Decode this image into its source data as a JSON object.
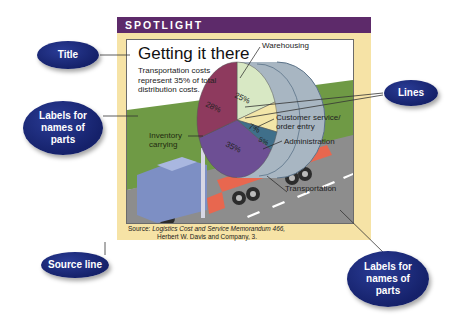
{
  "frame": {
    "header": "SPOTLIGHT",
    "title": "Getting it there",
    "subtitle": "Transportation costs represent 35% of total distribution costs.",
    "source_prefix": "Source: ",
    "source_italic": "Logistics Cost and Service Memorandum 466,",
    "source_line2": "Herbert W. Davis and Company, 3.",
    "part_labels": {
      "warehousing": "Warehousing",
      "inventory": "Inventory carrying",
      "customer_service": "Customer service/ order entry",
      "administration": "Administration",
      "transportation": "Transportation"
    },
    "pie_values": {
      "warehousing": "25%",
      "inventory": "28%",
      "customer_service": "7%",
      "administration": "5%",
      "transportation": "35%"
    }
  },
  "callouts": {
    "title": "Title",
    "labels_left": "Labels for names of parts",
    "lines": "Lines",
    "source_line": "Source line",
    "labels_right": "Labels for names of parts"
  },
  "colors": {
    "header": "#5d2a6a",
    "frame": "#f6e3a6",
    "bubble": "#1b2a7e",
    "grass": "#6f9a45",
    "road": "#8d8d8d",
    "inventory": "#8e3a5e",
    "warehousing": "#d8e8c4",
    "customer_service": "#f3e6a8",
    "administration": "#3f6f8a",
    "transportation": "#6d4f94"
  }
}
